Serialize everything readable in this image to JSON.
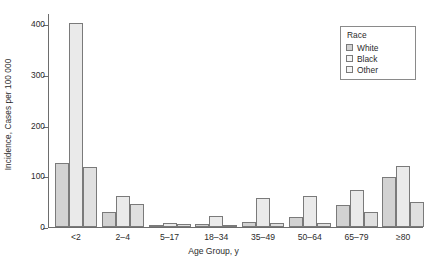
{
  "chart_data": {
    "type": "bar",
    "title": "",
    "xlabel": "Age Group, y",
    "ylabel": "Incidence, Cases per 100 000",
    "categories": [
      "<2",
      "2–4",
      "5–17",
      "18–34",
      "35–49",
      "50–64",
      "65–79",
      "≥80"
    ],
    "series": [
      {
        "name": "White",
        "color": "#d2d2d2",
        "values": [
          127,
          30,
          4,
          6,
          10,
          19,
          44,
          98
        ]
      },
      {
        "name": "Black",
        "color": "#eaeaea",
        "values": [
          403,
          61,
          7,
          22,
          58,
          62,
          73,
          120
        ]
      },
      {
        "name": "Other",
        "color": "#e0e0e0",
        "values": [
          119,
          45,
          6,
          4,
          8,
          8,
          30,
          50
        ]
      }
    ],
    "ylim": [
      0,
      420
    ],
    "yticks": [
      0,
      100,
      200,
      300,
      400
    ],
    "ytick_labels": [
      "0",
      "100",
      "200",
      "300",
      "400"
    ],
    "grid": false,
    "legend": {
      "title": "Race",
      "position": "top-right",
      "entries": [
        "White",
        "Black",
        "Other"
      ]
    }
  },
  "legend": {
    "title": "Race",
    "items": [
      {
        "label": "White"
      },
      {
        "label": "Black"
      },
      {
        "label": "Other"
      }
    ]
  }
}
